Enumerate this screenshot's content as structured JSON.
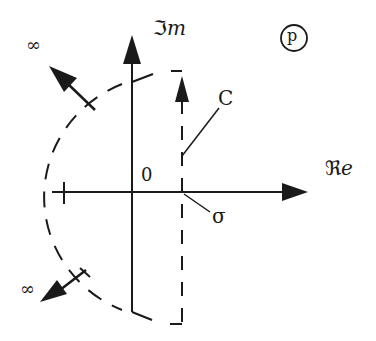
{
  "diagram": {
    "plane_label": "p",
    "imaginary_axis_label_symbol": "ℑ",
    "imaginary_axis_label_text": "m",
    "real_axis_label_symbol": "ℜ",
    "real_axis_label_text": "e",
    "origin_label": "0",
    "contour_label": "C",
    "abscissa_label": "σ",
    "infinity_upper_label": "∞",
    "infinity_lower_label": "∞",
    "colors": {
      "stroke": "#1a1a1a",
      "background": "#ffffff"
    }
  }
}
